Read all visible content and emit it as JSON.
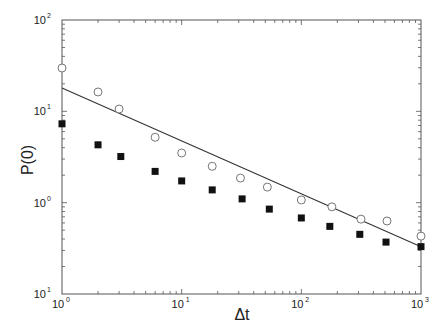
{
  "chart_data": {
    "type": "scatter",
    "title": "",
    "xlabel": "Δt",
    "ylabel": "P(0)",
    "xscale": "log",
    "yscale": "log",
    "xlim": [
      1,
      1000
    ],
    "ylim": [
      0.1,
      100
    ],
    "grid": false,
    "legend": null,
    "x_tick_labels": [
      {
        "base": "10",
        "exp": "0",
        "value": 1
      },
      {
        "base": "10",
        "exp": "1",
        "value": 10
      },
      {
        "base": "10",
        "exp": "2",
        "value": 100
      },
      {
        "base": "10",
        "exp": "3",
        "value": 1000
      }
    ],
    "y_tick_labels": [
      {
        "base": "10",
        "exp": "2",
        "value": 100
      },
      {
        "base": "10",
        "exp": "1",
        "value": 10
      },
      {
        "base": "10",
        "exp": "0",
        "value": 1
      },
      {
        "base": "10",
        "exp": "1",
        "value": 0.1
      }
    ],
    "series": [
      {
        "name": "open circles",
        "marker": "open-circle",
        "x": [
          1,
          2,
          3,
          6,
          10,
          18,
          31,
          52,
          100,
          180,
          315,
          520,
          1000
        ],
        "y": [
          29.8,
          16.3,
          10.6,
          5.2,
          3.5,
          2.5,
          1.86,
          1.48,
          1.07,
          0.9,
          0.66,
          0.63,
          0.43
        ]
      },
      {
        "name": "filled squares",
        "marker": "filled-square",
        "x": [
          1,
          2,
          3.1,
          6,
          10,
          18,
          32,
          54,
          100,
          173,
          308,
          510,
          1000
        ],
        "y": [
          7.3,
          4.3,
          3.2,
          2.2,
          1.73,
          1.38,
          1.1,
          0.85,
          0.68,
          0.55,
          0.45,
          0.37,
          0.33
        ]
      },
      {
        "name": "power-law fit",
        "marker": "line",
        "x": [
          1,
          1000
        ],
        "y": [
          18.0,
          0.33
        ]
      }
    ]
  }
}
